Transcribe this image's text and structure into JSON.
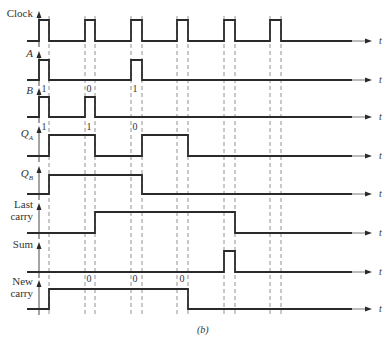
{
  "figure": {
    "caption": "(b)",
    "time_axis_label": "t",
    "baseline_x_start": 27,
    "baseline_solid_end": 352,
    "baseline_arrow_end": 372,
    "y_axis_x": 39,
    "dashed_line_top": 16,
    "dashed_line_bottom": 316,
    "clock_edges": [
      {
        "rise": 39,
        "fall": 49
      },
      {
        "rise": 85,
        "fall": 95
      },
      {
        "rise": 131,
        "fall": 142
      },
      {
        "rise": 177,
        "fall": 188
      },
      {
        "rise": 224,
        "fall": 235
      },
      {
        "rise": 270,
        "fall": 281
      }
    ],
    "colors": {
      "waveform": "#2a2a2a",
      "dashed": "#777777",
      "text": "#333333"
    }
  },
  "signals": [
    {
      "id": "clock",
      "label": "Clock",
      "label_lines": [
        "Clock"
      ],
      "italic": false,
      "high_y": 20,
      "low_y": 41,
      "pulses": [
        [
          39,
          49
        ],
        [
          85,
          95
        ],
        [
          131,
          142
        ],
        [
          177,
          188
        ],
        [
          224,
          235
        ],
        [
          270,
          281
        ]
      ],
      "bits": []
    },
    {
      "id": "a",
      "label": "A",
      "label_lines": [
        "A"
      ],
      "italic": true,
      "high_y": 60,
      "low_y": 80,
      "pulses": [
        [
          39,
          49
        ],
        [
          131,
          142
        ]
      ],
      "bits": [
        {
          "x": 44,
          "y": 92,
          "text": "1"
        },
        {
          "x": 89,
          "y": 92,
          "text": "0"
        },
        {
          "x": 135,
          "y": 92,
          "text": "1"
        }
      ]
    },
    {
      "id": "b",
      "label": "B",
      "label_lines": [
        "B"
      ],
      "italic": true,
      "high_y": 97,
      "low_y": 117,
      "pulses": [
        [
          39,
          49
        ],
        [
          85,
          95
        ]
      ],
      "bits": [
        {
          "x": 44,
          "y": 130,
          "text": "1"
        },
        {
          "x": 89,
          "y": 130,
          "text": "1"
        },
        {
          "x": 135,
          "y": 130,
          "text": "0"
        }
      ]
    },
    {
      "id": "qa",
      "label": "QA",
      "label_lines": [
        "Q",
        "A"
      ],
      "italic": true,
      "high_y": 135,
      "low_y": 156,
      "pulses": [
        [
          49,
          95
        ],
        [
          142,
          188
        ]
      ],
      "bits": []
    },
    {
      "id": "qb",
      "label": "QB",
      "label_lines": [
        "Q",
        "B"
      ],
      "italic": true,
      "high_y": 175,
      "low_y": 194,
      "pulses": [
        [
          49,
          142
        ]
      ],
      "bits": []
    },
    {
      "id": "last-carry",
      "label": "Last carry",
      "label_lines": [
        "Last",
        "carry"
      ],
      "italic": false,
      "high_y": 212,
      "low_y": 233,
      "pulses": [
        [
          95,
          235
        ]
      ],
      "bits": []
    },
    {
      "id": "sum",
      "label": "Sum",
      "label_lines": [
        "Sum"
      ],
      "italic": false,
      "high_y": 251,
      "low_y": 272,
      "pulses": [
        [
          224,
          235
        ]
      ],
      "bits": [
        {
          "x": 89,
          "y": 282,
          "text": "0"
        },
        {
          "x": 135,
          "y": 282,
          "text": "0"
        },
        {
          "x": 182,
          "y": 282,
          "text": "0"
        }
      ]
    },
    {
      "id": "new-carry",
      "label": "New carry",
      "label_lines": [
        "New",
        "carry"
      ],
      "italic": false,
      "high_y": 289,
      "low_y": 309,
      "pulses": [
        [
          49,
          188
        ]
      ],
      "bits": []
    }
  ]
}
